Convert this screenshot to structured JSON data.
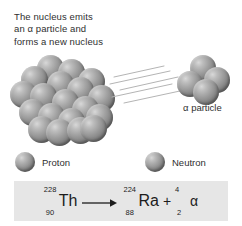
{
  "figure": {
    "caption": "The nucleus emits\nan α particle and\nforms a new nucleus"
  },
  "diagram": {
    "nucleus_label": "parent-nucleus",
    "alpha_label": "α particle",
    "motion_lines_count": 5,
    "nucleus_sphere_count": 19,
    "alpha_sphere_count": 4
  },
  "legend": {
    "items": [
      {
        "label": "Proton",
        "color": "#8e8e8e"
      },
      {
        "label": "Neutron",
        "color": "#8e8e8e"
      }
    ]
  },
  "equation": {
    "box_color": "#e6e6e6",
    "reactant": {
      "mass_number": "228",
      "atomic_number": "90",
      "symbol": "Th"
    },
    "arrow": "→",
    "product": {
      "mass_number": "224",
      "atomic_number": "88",
      "symbol": "Ra"
    },
    "plus": "+",
    "emitted": {
      "mass_number": "4",
      "atomic_number": "2",
      "symbol": "α"
    }
  }
}
